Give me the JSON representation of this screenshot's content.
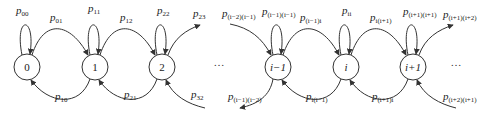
{
  "diagram": {
    "type": "markov-chain-state-transition",
    "stroke_color": "#333333",
    "nodes": [
      {
        "id": "0",
        "label": "0",
        "x": 27,
        "y": 67
      },
      {
        "id": "1",
        "label": "1",
        "x": 95,
        "y": 67
      },
      {
        "id": "2",
        "label": "2",
        "x": 162,
        "y": 67
      },
      {
        "id": "i-1",
        "label": "i−1",
        "x": 278,
        "y": 67
      },
      {
        "id": "i",
        "label": "i",
        "x": 346,
        "y": 67
      },
      {
        "id": "i+1",
        "label": "i+1",
        "x": 413,
        "y": 67
      }
    ],
    "ellipses": [
      "…",
      "…"
    ],
    "edges": [
      {
        "from": "0",
        "to": "0",
        "kind": "self-loop",
        "label_main": "p",
        "label_sub": "00"
      },
      {
        "from": "0",
        "to": "1",
        "kind": "forward",
        "label_main": "p",
        "label_sub": "01"
      },
      {
        "from": "1",
        "to": "1",
        "kind": "self-loop",
        "label_main": "p",
        "label_sub": "11"
      },
      {
        "from": "1",
        "to": "2",
        "kind": "forward",
        "label_main": "p",
        "label_sub": "12"
      },
      {
        "from": "2",
        "to": "2",
        "kind": "self-loop",
        "label_main": "p",
        "label_sub": "22"
      },
      {
        "from": "2",
        "to": "3",
        "kind": "forward-out",
        "label_main": "p",
        "label_sub": "23"
      },
      {
        "from": "1",
        "to": "0",
        "kind": "backward",
        "label_main": "p",
        "label_sub": "10"
      },
      {
        "from": "2",
        "to": "1",
        "kind": "backward",
        "label_main": "p",
        "label_sub": "21"
      },
      {
        "from": "3",
        "to": "2",
        "kind": "backward-in",
        "label_main": "p",
        "label_sub": "32"
      },
      {
        "from": "i-2",
        "to": "i-1",
        "kind": "forward-in",
        "label_main": "p",
        "label_sub": "(i−2)(i−1)"
      },
      {
        "from": "i-1",
        "to": "i-1",
        "kind": "self-loop",
        "label_main": "p",
        "label_sub": "(i−1)(i−1)"
      },
      {
        "from": "i-1",
        "to": "i",
        "kind": "forward",
        "label_main": "p",
        "label_sub": "(i−1)i"
      },
      {
        "from": "i",
        "to": "i",
        "kind": "self-loop",
        "label_main": "p",
        "label_sub": "ii"
      },
      {
        "from": "i",
        "to": "i+1",
        "kind": "forward",
        "label_main": "p",
        "label_sub": "i(i+1)"
      },
      {
        "from": "i+1",
        "to": "i+1",
        "kind": "self-loop",
        "label_main": "p",
        "label_sub": "(i+1)(i+1)"
      },
      {
        "from": "i+1",
        "to": "i+2",
        "kind": "forward-out",
        "label_main": "p",
        "label_sub": "(i+1)(i+2)"
      },
      {
        "from": "i-1",
        "to": "i-2",
        "kind": "backward-out",
        "label_main": "p",
        "label_sub": "(i−1)(i−2)"
      },
      {
        "from": "i",
        "to": "i-1",
        "kind": "backward",
        "label_main": "p",
        "label_sub": "i(i−1)"
      },
      {
        "from": "i+1",
        "to": "i",
        "kind": "backward",
        "label_main": "p",
        "label_sub": "(i+1)i"
      },
      {
        "from": "i+2",
        "to": "i+1",
        "kind": "backward-in",
        "label_main": "p",
        "label_sub": "(i+2)(i+1)"
      }
    ]
  }
}
